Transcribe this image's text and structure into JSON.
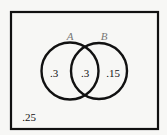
{
  "diagram": {
    "type": "venn",
    "sets": [
      {
        "name": "A",
        "only_value": ".3"
      },
      {
        "name": "B",
        "only_value": ".15"
      }
    ],
    "intersection_value": ".3",
    "outside_value": ".25",
    "colors": {
      "stroke": "#111111",
      "label": "#777777",
      "background": "#f7f7f5"
    }
  }
}
